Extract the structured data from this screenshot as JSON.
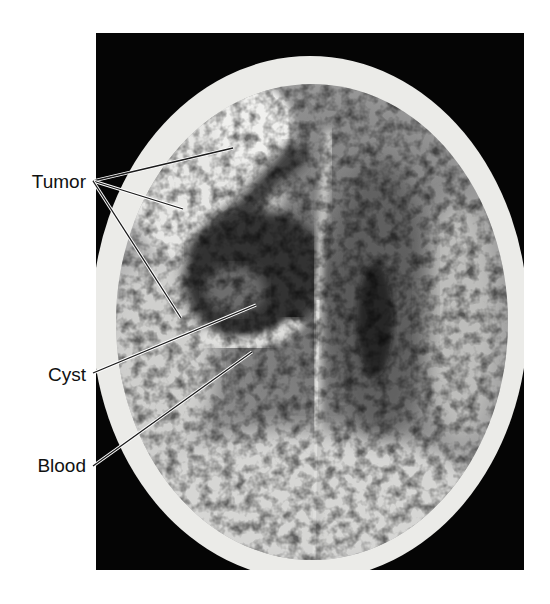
{
  "figure": {
    "type": "axial CT scan of head, annotated",
    "frame": {
      "x": 96,
      "y": 33,
      "width": 428,
      "height": 537,
      "background": "#050505"
    },
    "skull": {
      "cx": 310,
      "cy": 318,
      "rx": 218,
      "ry": 262,
      "bone_color": "#ececea"
    },
    "labels": [
      {
        "id": "tumor",
        "text": "Tumor",
        "x": 6,
        "y": 172,
        "anchor": {
          "x": 93,
          "y": 181
        },
        "leaders": [
          {
            "x": 233,
            "y": 148
          },
          {
            "x": 183,
            "y": 209
          },
          {
            "x": 181,
            "y": 318
          }
        ]
      },
      {
        "id": "cyst",
        "text": "Cyst",
        "x": 6,
        "y": 365,
        "anchor": {
          "x": 93,
          "y": 373
        },
        "leaders": [
          {
            "x": 256,
            "y": 305
          }
        ]
      },
      {
        "id": "blood",
        "text": "Blood",
        "x": 6,
        "y": 456,
        "anchor": {
          "x": 93,
          "y": 466
        },
        "leaders": [
          {
            "x": 252,
            "y": 352
          }
        ]
      }
    ],
    "colors": {
      "leader_line": "#1a1a1a",
      "leader_halo": "#ffffff",
      "label_text": "#111111"
    }
  }
}
